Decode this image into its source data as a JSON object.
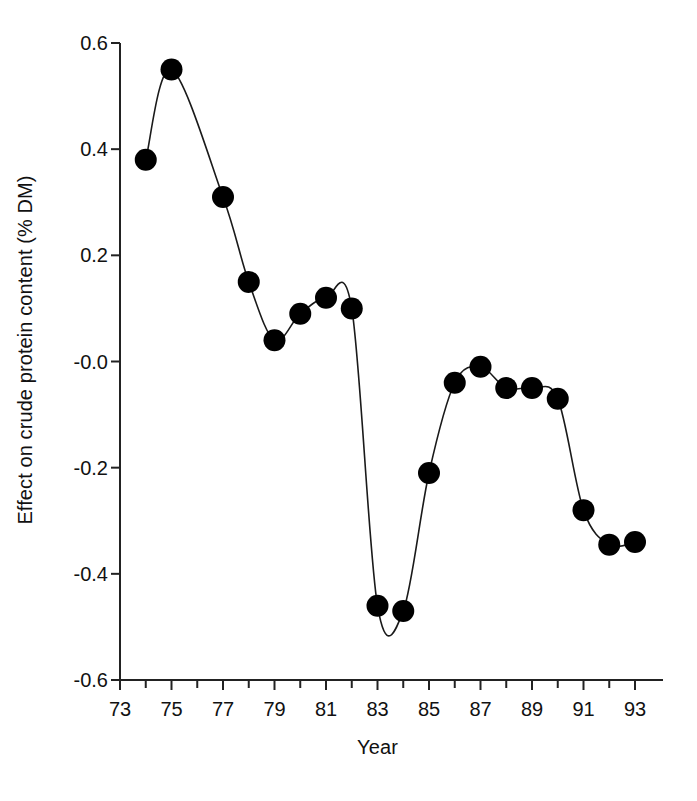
{
  "chart_data": {
    "type": "line",
    "title": "",
    "xlabel": "Year",
    "ylabel": "Effect on crude protein content (% DM)",
    "x": [
      74,
      75,
      76,
      77,
      78,
      79,
      80,
      81,
      82,
      83,
      84,
      85,
      86,
      87,
      88,
      89,
      90,
      91,
      92,
      93
    ],
    "values": [
      0.38,
      0.55,
      0.44,
      0.31,
      0.15,
      0.04,
      0.09,
      0.12,
      0.1,
      -0.46,
      -0.47,
      -0.21,
      -0.04,
      -0.01,
      -0.05,
      -0.05,
      -0.07,
      -0.28,
      -0.345,
      -0.34
    ],
    "x_display": [
      "74",
      "75",
      "76",
      "77",
      "78",
      "79",
      "80",
      "81",
      "82",
      "83",
      "84",
      "85",
      "86",
      "87",
      "88",
      "89",
      "90",
      "91",
      "92",
      "93"
    ],
    "point_count": 19,
    "points": [
      {
        "x": 74,
        "y": 0.38
      },
      {
        "x": 75,
        "y": 0.55
      },
      {
        "x": 77,
        "y": 0.31
      },
      {
        "x": 78,
        "y": 0.15
      },
      {
        "x": 79,
        "y": 0.04
      },
      {
        "x": 80,
        "y": 0.09
      },
      {
        "x": 81,
        "y": 0.12
      },
      {
        "x": 82,
        "y": 0.1
      },
      {
        "x": 83,
        "y": -0.46
      },
      {
        "x": 84,
        "y": -0.47
      },
      {
        "x": 85,
        "y": -0.21
      },
      {
        "x": 86,
        "y": -0.04
      },
      {
        "x": 87,
        "y": -0.01
      },
      {
        "x": 88,
        "y": -0.05
      },
      {
        "x": 89,
        "y": -0.05
      },
      {
        "x": 90,
        "y": -0.07
      },
      {
        "x": 91,
        "y": -0.28
      },
      {
        "x": 92,
        "y": -0.345
      },
      {
        "x": 93,
        "y": -0.34
      }
    ],
    "xlim": [
      73,
      94
    ],
    "ylim": [
      -0.6,
      0.6
    ],
    "x_ticks": [
      73,
      74,
      75,
      76,
      77,
      78,
      79,
      80,
      81,
      82,
      83,
      84,
      85,
      86,
      87,
      88,
      89,
      90,
      91,
      92,
      93
    ],
    "x_tick_labels": [
      "73",
      "",
      "75",
      "",
      "77",
      "",
      "79",
      "",
      "81",
      "",
      "83",
      "",
      "85",
      "",
      "87",
      "",
      "89",
      "",
      "91",
      "",
      "93"
    ],
    "y_ticks": [
      0.6,
      0.4,
      0.2,
      0.0,
      -0.2,
      -0.4,
      -0.6
    ],
    "y_tick_labels": [
      "0.6",
      "0.4",
      "0.2",
      "-0.0",
      "-0.2",
      "-0.4",
      "-0.6"
    ],
    "grid": false,
    "legend": "none",
    "marker": "filled-circle",
    "marker_color": "#000000",
    "line_color": "#1a1a1a",
    "background": "#ffffff"
  }
}
